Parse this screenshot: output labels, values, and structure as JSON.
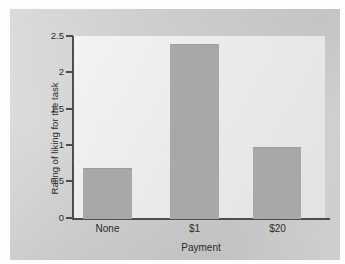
{
  "chart_data": {
    "type": "bar",
    "title": "",
    "xlabel": "Payment",
    "ylabel": "Rating of liking for the task",
    "categories": [
      "None",
      "$1",
      "$20"
    ],
    "values": [
      0.68,
      2.38,
      0.97
    ],
    "ylim": [
      0,
      2.5
    ],
    "yticks": [
      0,
      0.5,
      1,
      1.5,
      2,
      2.5
    ],
    "ytick_labels": [
      "0",
      "0.5",
      "1",
      "1.5",
      "2",
      "2.5"
    ],
    "grid": false,
    "legend": false,
    "legend_position": "none",
    "series": [
      {
        "name": "Rating of liking for the task",
        "values": [
          0.68,
          2.38,
          0.97
        ]
      }
    ]
  },
  "style": {
    "bar_color": "#a8a8a8",
    "plot_background": "#eaeaea",
    "figure_background": "#cfcfcf",
    "axis_color": "#4d4d4d",
    "text_color": "#2a2a2a"
  }
}
